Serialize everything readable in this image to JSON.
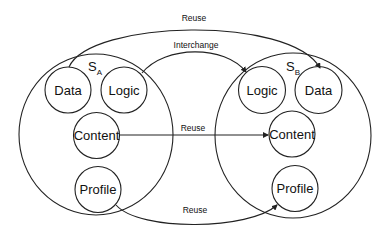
{
  "diagram": {
    "type": "set-reuse-diagram",
    "colors": {
      "stroke": "#222222",
      "text": "#111111",
      "background": "#ffffff"
    },
    "sets": [
      {
        "id": "SA",
        "label": "S",
        "subscript": "A",
        "nodes": {
          "data": "Data",
          "logic": "Logic",
          "content": "Content",
          "profile": "Profile"
        }
      },
      {
        "id": "SB",
        "label": "S",
        "subscript": "B",
        "nodes": {
          "logic": "Logic",
          "data": "Data",
          "content": "Content",
          "profile": "Profile"
        }
      }
    ],
    "edges": [
      {
        "from": "SA.Data",
        "to": "SB.Data",
        "label": "Reuse"
      },
      {
        "from": "SA.Logic",
        "to": "SB.Logic",
        "label": "Interchange"
      },
      {
        "from": "SA.Content",
        "to": "SB.Content",
        "label": "Reuse"
      },
      {
        "from": "SA.Profile",
        "to": "SB.Profile",
        "label": "Reuse"
      }
    ]
  }
}
